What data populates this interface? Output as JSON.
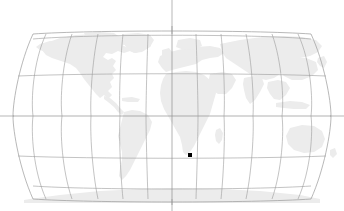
{
  "figure": {
    "title": "",
    "width": 344,
    "height": 211,
    "background_color": "#ffffff"
  },
  "map": {
    "projection": "robinson",
    "land_color": "#ececec",
    "ocean_color": "#ffffff",
    "graticule_color": "#9a9a9a",
    "outline_color": "#9a9a9a",
    "center_longitude": 0,
    "graticule": {
      "meridian_step_degrees": 30,
      "parallel_step_degrees": 30,
      "meridians": [
        -180,
        -150,
        -120,
        -90,
        -60,
        -30,
        0,
        30,
        60,
        90,
        120,
        150,
        180
      ],
      "parallels": [
        -60,
        -30,
        0,
        30,
        60
      ]
    },
    "axis_lines": {
      "equator_label": "equator",
      "central_meridian_label": "prime-meridian"
    }
  },
  "markers": {
    "count": 1,
    "color": "#000000",
    "shape": "square",
    "size_px": 4,
    "points": [
      {
        "name": "data-point-1",
        "x_px": 190,
        "y_px": 155,
        "lon": 22,
        "lat": -34
      }
    ]
  },
  "legend": {
    "visible": false,
    "entries": []
  }
}
